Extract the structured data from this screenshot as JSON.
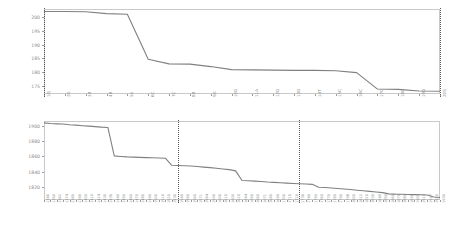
{
  "figure": {
    "background_color": "#ffffff",
    "line_color": "#808080",
    "frame_color": "#c9c9c9",
    "tick_label_color": "#8a8a8a",
    "vline_color": "#5a5a5a",
    "panel_count": 2
  },
  "chart_data": [
    {
      "type": "line",
      "title": "",
      "subtitle": "",
      "xlabel": "",
      "ylabel": "",
      "grid": false,
      "legend": "none",
      "ylim": [
        172,
        203
      ],
      "yticks": [
        175,
        180,
        185,
        190,
        195,
        200
      ],
      "ytick_labels": [
        "175",
        "180",
        "185",
        "190",
        "195",
        "200"
      ],
      "categories": [
        "10J",
        "2G",
        "3B",
        "4B",
        "5A",
        "6C",
        "7C",
        "8B",
        "9G",
        "10G",
        "11A",
        "12G",
        "13G",
        "14T",
        "15C",
        "16C",
        "17C",
        "18G",
        "19G",
        "20S"
      ],
      "values": [
        202.1,
        202.1,
        202.0,
        201.3,
        201.1,
        184.7,
        183.0,
        182.9,
        182.0,
        180.9,
        180.8,
        180.7,
        180.6,
        180.6,
        180.5,
        179.8,
        173.8,
        173.7,
        173.1,
        173.0
      ],
      "annotations": [
        {
          "type": "vline",
          "x_category": "10J",
          "style": "dotted"
        },
        {
          "type": "vline",
          "x_category": "20S",
          "style": "dotted"
        }
      ]
    },
    {
      "type": "line",
      "title": "",
      "subtitle": "",
      "xlabel": "",
      "ylabel": "",
      "grid": false,
      "legend": "none",
      "ylim": [
        1803,
        1906
      ],
      "yticks": [
        1820,
        1840,
        1860,
        1880,
        1900
      ],
      "ytick_labels": [
        "1820",
        "1840",
        "1860",
        "1880",
        "1900"
      ],
      "categories": [
        "1340",
        "1350",
        "1362",
        "1374",
        "1380",
        "1390",
        "1400",
        "1410",
        "1424",
        "1430",
        "1435",
        "1440",
        "1450",
        "1460",
        "1470",
        "1480",
        "1490",
        "1500",
        "1510",
        "1520",
        "1530",
        "1540",
        "1550",
        "1560",
        "1571",
        "1584",
        "1590",
        "1600",
        "1610",
        "1600",
        "1620",
        "1644",
        "1650",
        "1660",
        "1671",
        "1680",
        "1690",
        "1700",
        "1710",
        "1720",
        "1730",
        "1740",
        "1750",
        "1760",
        "1770",
        "1780",
        "1790",
        "1798",
        "1800",
        "1812",
        "1820",
        "1830",
        "1840",
        "1850",
        "1860",
        "1870",
        "1880",
        "1890",
        "1900",
        "1910",
        "1917",
        "1920",
        "1930"
      ],
      "values": [
        1903.5,
        1902.7,
        1902.3,
        1902.0,
        1901.2,
        1900.6,
        1899.9,
        1899.3,
        1898.7,
        1898.0,
        1897.6,
        1860.5,
        1859.8,
        1859.2,
        1858.9,
        1858.6,
        1858.3,
        1858.0,
        1857.8,
        1857.5,
        1848.3,
        1847.9,
        1847.6,
        1847.3,
        1846.6,
        1845.9,
        1845.2,
        1844.4,
        1843.5,
        1842.6,
        1841.0,
        1828.5,
        1828.1,
        1827.6,
        1827.2,
        1826.5,
        1826.0,
        1825.5,
        1825.0,
        1824.6,
        1824.2,
        1823.8,
        1823.4,
        1819.7,
        1819.2,
        1818.6,
        1818.0,
        1817.3,
        1816.6,
        1815.8,
        1815.0,
        1814.2,
        1813.4,
        1812.6,
        1811.0,
        1810.6,
        1810.4,
        1810.2,
        1810.0,
        1809.8,
        1809.6,
        1807.0,
        1806.2
      ],
      "annotations": [
        {
          "type": "vline",
          "x_category": "1540",
          "style": "dotted"
        },
        {
          "type": "vline",
          "x_category": "1730",
          "style": "dotted"
        }
      ]
    }
  ]
}
